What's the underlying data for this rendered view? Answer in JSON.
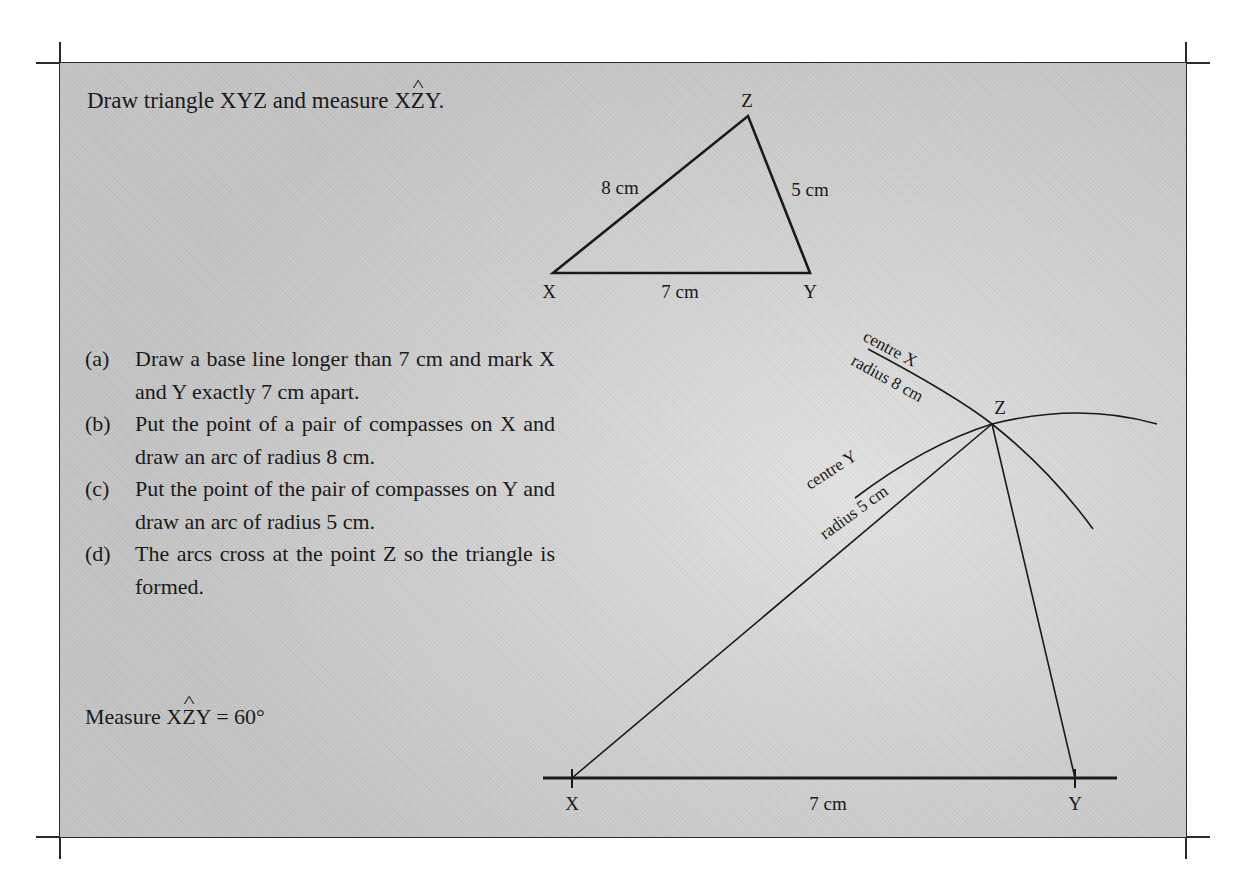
{
  "header": {
    "title_prefix": "Draw triangle XYZ and measure X",
    "title_hat_letter": "Z",
    "title_suffix": "Y."
  },
  "sketch_triangle": {
    "vertices": {
      "X": {
        "label": "X",
        "x": 553,
        "y": 273
      },
      "Y": {
        "label": "Y",
        "x": 810,
        "y": 273
      },
      "Z": {
        "label": "Z",
        "x": 748,
        "y": 116
      }
    },
    "sides": {
      "XZ": "8 cm",
      "YZ": "5 cm",
      "XY": "7 cm"
    }
  },
  "steps": [
    {
      "marker": "(a)",
      "text": "Draw a base line longer than 7 cm and mark X and Y exactly 7 cm apart."
    },
    {
      "marker": "(b)",
      "text": "Put the point of a pair of compasses on X and draw an arc of radius 8 cm."
    },
    {
      "marker": "(c)",
      "text": "Put the point of the pair of compasses on Y and draw an arc of radius 5 cm."
    },
    {
      "marker": "(d)",
      "text": "The arcs cross at the point Z so the triangle is formed."
    }
  ],
  "result": {
    "prefix": "Measure X",
    "hat_letter": "Z",
    "suffix": "Y = 60°"
  },
  "construction": {
    "baseline_label": "7 cm",
    "point_X": "X",
    "point_Y": "Y",
    "point_Z": "Z",
    "arc_x_label_line1": "centre X",
    "arc_x_label_line2": "radius 8 cm",
    "arc_y_label_line1": "centre Y",
    "arc_y_label_line2": "radius 5 cm"
  },
  "colors": {
    "ink": "#1a1a1a",
    "panel_gray": "#c8c8c8",
    "panel_light": "#e2e2e2"
  }
}
